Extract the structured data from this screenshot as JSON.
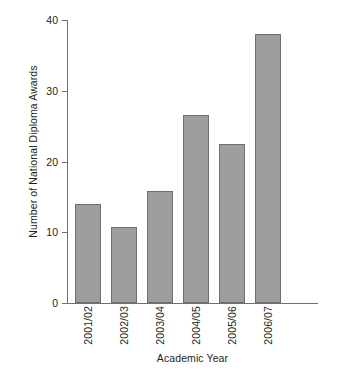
{
  "chart_data": {
    "type": "bar",
    "title": "",
    "xlabel": "Academic Year",
    "ylabel": "Number of National Diploma Awards",
    "categories": [
      "2001/02",
      "2002/03",
      "2003/04",
      "2004/05",
      "2005/06",
      "2006/07"
    ],
    "values": [
      14,
      10.7,
      15.8,
      26.6,
      22.5,
      38
    ],
    "ylim": [
      0,
      40
    ],
    "yticks": [
      0,
      10,
      20,
      30,
      40
    ],
    "ytick_labels": [
      "0",
      "10",
      "20",
      "30",
      "40"
    ],
    "grid": false,
    "legend": null,
    "series": [
      {
        "name": "National Diploma Awards",
        "values": [
          14,
          10.7,
          15.8,
          26.6,
          22.5,
          38
        ]
      }
    ],
    "colors": {
      "bar_fill": "#9e9e9e",
      "bar_outline": "#6e6e6e",
      "axis": "#6f6f6f",
      "text": "#231f20",
      "background": "#ffffff"
    }
  }
}
